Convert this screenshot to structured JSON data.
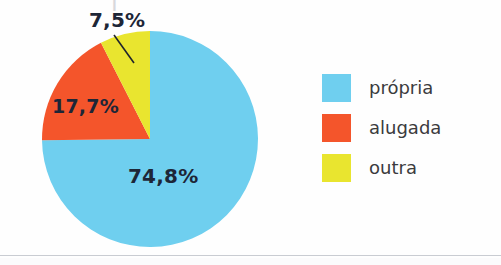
{
  "figure": {
    "background_color": "#fefefe",
    "top_crop_remnant": "|",
    "divider_color": "#c9ccd2"
  },
  "chart_data": {
    "type": "pie",
    "title": "",
    "subtitle": "",
    "xlabel": "",
    "ylabel": "",
    "categories": [
      "própria",
      "alugada",
      "outra"
    ],
    "values": [
      74.8,
      17.7,
      7.5
    ],
    "value_labels": [
      "74,8%",
      "17,7%",
      "7,5%"
    ],
    "colors": [
      "#6FCFEF",
      "#F4552B",
      "#E9E52F"
    ],
    "units": "%",
    "legend_position": "right",
    "grid": false,
    "start_angle_deg": 0,
    "direction": "clockwise",
    "label_text_color": "#1d2637",
    "has_leader_line": true,
    "leader_line_for": "outra"
  },
  "pie": {
    "center_x": 109,
    "center_y": 109,
    "radius": 108,
    "slices": [
      {
        "name": "própria",
        "label": "74,8%",
        "value": 74.8,
        "color": "#6FCFEF",
        "path": "M 109 109 L 109 1 A 108 108 0 1 1 31.1 74.6 Z"
      },
      {
        "name": "alugada",
        "label": "17,7%",
        "value": 17.7,
        "color": "#F4552B",
        "path": "M 109 109 L 31.1 74.6 A 108 108 0 0 1 66.0 19.6 Z"
      },
      {
        "name": "outra",
        "label": "7,5%",
        "value": 7.5,
        "color": "#E9E52F",
        "path": "M 109 109 L 66.0 19.6 A 108 108 0 0 1 109 1 Z"
      }
    ]
  },
  "legend": {
    "items": [
      {
        "label": "própria",
        "color": "#6FCFEF",
        "swatch_name": "legend-swatch-propria"
      },
      {
        "label": "alugada",
        "color": "#F4552B",
        "swatch_name": "legend-swatch-alugada"
      },
      {
        "label": "outra",
        "color": "#E9E52F",
        "swatch_name": "legend-swatch-outra"
      }
    ]
  }
}
